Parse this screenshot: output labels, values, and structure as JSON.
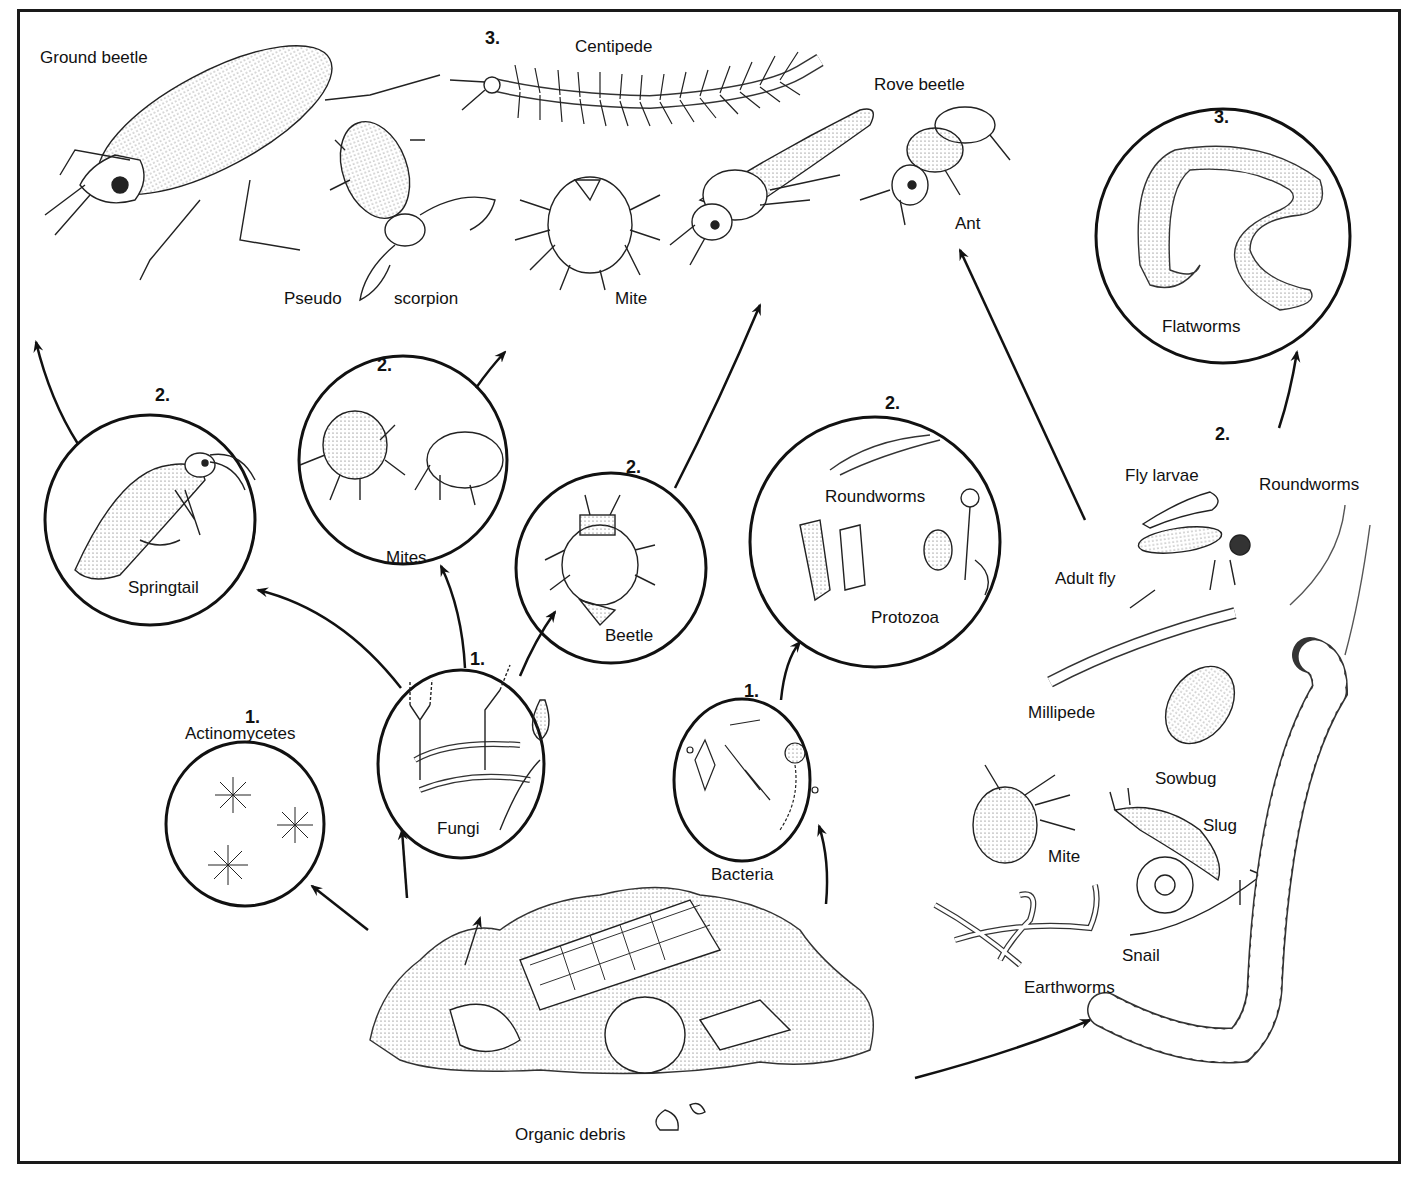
{
  "diagram": {
    "frame_color": "#1a1a1a",
    "ink_color": "#111111",
    "background": "#ffffff"
  },
  "levels": {
    "one": "1.",
    "two": "2.",
    "three": "3."
  },
  "nodes": {
    "organic_debris": {
      "label": "Organic debris",
      "level": "0"
    },
    "actinomycetes": {
      "label": "Actinomycetes",
      "level": "1."
    },
    "fungi": {
      "label": "Fungi",
      "level": "1."
    },
    "bacteria": {
      "label": "Bacteria",
      "level": "1."
    },
    "springtail": {
      "label": "Springtail",
      "level": "2."
    },
    "mites": {
      "label": "Mites",
      "level": "2."
    },
    "beetle": {
      "label": "Beetle",
      "level": "2."
    },
    "roundworms_protozoa": {
      "labels": [
        "Roundworms",
        "Protozoa"
      ],
      "level": "2."
    },
    "flatworms": {
      "label": "Flatworms",
      "level": "3."
    },
    "detritivores_group": {
      "level": "2.",
      "labels": [
        "Fly larvae",
        "Roundworms",
        "Adult fly",
        "Millipede",
        "Sowbug",
        "Mite",
        "Slug",
        "Snail",
        "Earthworms"
      ]
    },
    "predators_group": {
      "level": "3.",
      "labels": [
        "Ground beetle",
        "Centipede",
        "Rove beetle",
        "Pseudo",
        "scorpion",
        "Mite",
        "Ant"
      ]
    }
  },
  "edges": [
    {
      "from": "Organic debris",
      "to": "Actinomycetes"
    },
    {
      "from": "Organic debris",
      "to": "Fungi"
    },
    {
      "from": "Organic debris",
      "to": "Bacteria"
    },
    {
      "from": "Organic debris",
      "to": "Detritivores"
    },
    {
      "from": "Fungi",
      "to": "Springtail"
    },
    {
      "from": "Fungi",
      "to": "Mites"
    },
    {
      "from": "Fungi",
      "to": "Beetle"
    },
    {
      "from": "Bacteria",
      "to": "Roundworms / Protozoa"
    },
    {
      "from": "Springtail",
      "to": "Predators"
    },
    {
      "from": "Mites",
      "to": "Predators"
    },
    {
      "from": "Beetle",
      "to": "Predators"
    },
    {
      "from": "Detritivores",
      "to": "Predators"
    },
    {
      "from": "Detritivores",
      "to": "Flatworms"
    }
  ]
}
